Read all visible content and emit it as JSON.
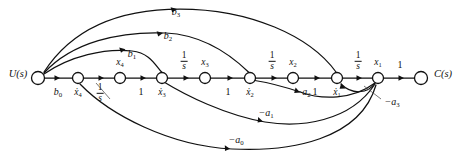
{
  "figure": {
    "type": "signal-flow-graph",
    "background_color": "#ffffff",
    "line_color": "#111111"
  },
  "nodes": [
    {
      "id": "u",
      "label": "U(s)",
      "label_position": "left",
      "x": 38,
      "y": 78,
      "r": 6.5
    },
    {
      "id": "xd4",
      "label": "x̄4",
      "label_position": "below",
      "x": 78,
      "y": 78,
      "r": 5.5
    },
    {
      "id": "x4",
      "label": "x4",
      "label_position": "above",
      "x": 120,
      "y": 78,
      "r": 5.5
    },
    {
      "id": "xd3",
      "label": "x̄3",
      "label_position": "below",
      "x": 162,
      "y": 78,
      "r": 5.5
    },
    {
      "id": "x3",
      "label": "x3",
      "label_position": "above",
      "x": 205,
      "y": 78,
      "r": 5.5
    },
    {
      "id": "xd2",
      "label": "x̄2",
      "label_position": "below",
      "x": 250,
      "y": 78,
      "r": 5.5
    },
    {
      "id": "x2",
      "label": "x2",
      "label_position": "above",
      "x": 293,
      "y": 78,
      "r": 5.5
    },
    {
      "id": "xd1",
      "label": "x̄1",
      "label_position": "below",
      "x": 337,
      "y": 78,
      "r": 5.5
    },
    {
      "id": "x1",
      "label": "x1",
      "label_position": "above",
      "x": 378,
      "y": 78,
      "r": 5.5
    },
    {
      "id": "c",
      "label": "C(s)",
      "label_position": "right",
      "x": 421,
      "y": 78,
      "r": 6.5
    }
  ],
  "node_labels": {
    "u": {
      "text": "U(s)",
      "x": 18,
      "y": 74
    },
    "xd4": {
      "text": "x4",
      "x": 78,
      "y": 92,
      "dot": true
    },
    "x4": {
      "text": "x4",
      "x": 120,
      "y": 64,
      "dot": false
    },
    "xd3": {
      "text": "x3",
      "x": 162,
      "y": 92,
      "dot": true
    },
    "x3": {
      "text": "x3",
      "x": 205,
      "y": 64,
      "dot": false
    },
    "xd2": {
      "text": "x2",
      "x": 250,
      "y": 92,
      "dot": true
    },
    "x2": {
      "text": "x2",
      "x": 293,
      "y": 64,
      "dot": false
    },
    "xd1": {
      "text": "x1",
      "x": 337,
      "y": 92,
      "dot": true
    },
    "x1": {
      "text": "x1",
      "x": 378,
      "y": 64,
      "dot": false
    },
    "c": {
      "text": "C(s)",
      "x": 443,
      "y": 74
    }
  },
  "forward_edges": [
    {
      "from": "u",
      "to": "xd4",
      "gain": "b0",
      "gain_type": "sub",
      "label_x": 58,
      "label_y": 92
    },
    {
      "from": "xd4",
      "to": "x4",
      "gain": "1/s",
      "gain_type": "frac",
      "label_x": 100,
      "label_y": 92
    },
    {
      "from": "x4",
      "to": "xd3",
      "gain": "1",
      "gain_type": "plain",
      "label_x": 141,
      "label_y": 92
    },
    {
      "from": "xd3",
      "to": "x3",
      "gain": "1/s",
      "gain_type": "frac",
      "label_x": 184,
      "label_y": 62
    },
    {
      "from": "x3",
      "to": "xd2",
      "gain": "1",
      "gain_type": "plain",
      "label_x": 228,
      "label_y": 92
    },
    {
      "from": "xd2",
      "to": "x2",
      "gain": "1/s",
      "gain_type": "frac",
      "label_x": 272,
      "label_y": 62
    },
    {
      "from": "x2",
      "to": "xd1",
      "gain": "1",
      "gain_type": "plain",
      "label_x": 315,
      "label_y": 92
    },
    {
      "from": "xd1",
      "to": "x1",
      "gain": "1/s",
      "gain_type": "frac",
      "label_x": 358,
      "label_y": 62
    },
    {
      "from": "x1",
      "to": "c",
      "gain": "1",
      "gain_type": "plain",
      "label_x": 400,
      "label_y": 66
    }
  ],
  "feedforward_edges": [
    {
      "gain": "b1",
      "from": "u",
      "to": "xd3",
      "label_x": 132,
      "label_y": 56
    },
    {
      "gain": "b2",
      "from": "u",
      "to": "xd2",
      "label_x": 168,
      "label_y": 38
    },
    {
      "gain": "b3",
      "from": "u",
      "to": "xd1",
      "label_x": 176,
      "label_y": 14
    }
  ],
  "feedback_edges": [
    {
      "gain": "-a0",
      "from": "x1",
      "to": "xd4",
      "label_x": 235,
      "label_y": 142
    },
    {
      "gain": "-a1",
      "from": "x1",
      "to": "xd3",
      "label_x": 265,
      "label_y": 115
    },
    {
      "gain": "-a2",
      "from": "x1",
      "to": "xd2",
      "label_x": 303,
      "label_y": 92
    },
    {
      "gain": "-a3",
      "from": "x1",
      "to": "xd1",
      "label_x": 388,
      "label_y": 103
    }
  ],
  "annotations": {
    "a3_leader": {
      "from_x": 381,
      "from_y": 99,
      "to_x": 362,
      "to_y": 85
    },
    "xd4_leader": {
      "from_x": 110,
      "from_y": 99,
      "to_x": 95,
      "to_y": 82
    }
  }
}
